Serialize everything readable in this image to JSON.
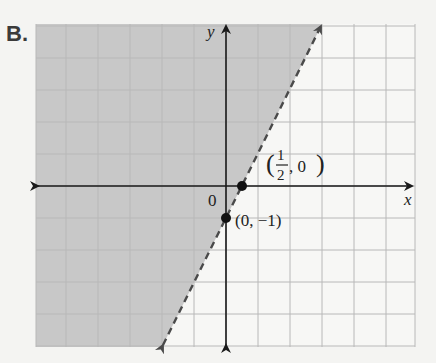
{
  "panel_label": "B.",
  "chart_data": {
    "type": "line",
    "title": "",
    "xlabel": "x",
    "ylabel": "y",
    "xlim": [
      -6,
      6
    ],
    "ylim": [
      -5,
      5
    ],
    "grid": true,
    "grid_step": 1,
    "origin_label": "0",
    "boundary_line": {
      "equation": "y = 2x - 1",
      "style": "dashed",
      "slope": 2,
      "intercept": -1,
      "endpoints": [
        [
          -2,
          -5
        ],
        [
          3,
          5
        ]
      ]
    },
    "shaded_region": {
      "description": "region above/left of line (y > 2x - 1)",
      "inequality": "y > 2x - 1",
      "color": "#c8c8c8"
    },
    "points": [
      {
        "x": 0.5,
        "y": 0,
        "label_num": "1",
        "label_den": "2",
        "label_rest": ", 0"
      },
      {
        "x": 0,
        "y": -1,
        "label": "(0, −1)"
      }
    ]
  },
  "colors": {
    "background": "#f4f4f2",
    "shade": "#c8c8c8",
    "grid": "#b8b8b8",
    "axis": "#1a1a1a",
    "line": "#4a4a4a"
  }
}
